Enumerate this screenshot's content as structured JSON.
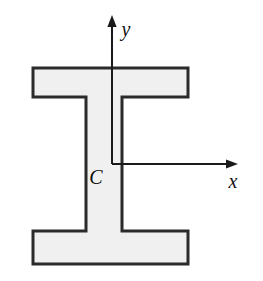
{
  "figure": {
    "kind": "engineering-cross-section-diagram",
    "background_color": "#ffffff",
    "width": 263,
    "height": 281
  },
  "shape": {
    "name": "I-beam-cross-section",
    "fill_color": "#f0f0f0",
    "stroke_color": "#2b2b2b",
    "stroke_width": 3,
    "outline_path": "M 33 68 L 188 68 L 188 97 L 122 97 L 122 231 L 188 231 L 188 264 L 33 264 L 33 231 L 86 231 L 86 97 L 33 97 Z",
    "parts": {
      "top_flange": {
        "label": "top flange",
        "x1": 33,
        "y1": 68,
        "x2": 188,
        "y2": 97
      },
      "web": {
        "label": "web",
        "x1": 86,
        "y1": 97,
        "x2": 122,
        "y2": 231
      },
      "bottom_flange": {
        "label": "bottom flange",
        "x1": 33,
        "y1": 231,
        "x2": 188,
        "y2": 264
      }
    }
  },
  "axes": {
    "stroke_color": "#1a1a1a",
    "stroke_width": 2,
    "origin": {
      "x": 112,
      "y": 164
    },
    "y_axis": {
      "label": "y",
      "label_x": 126,
      "label_y": 36,
      "label_size": 20,
      "line": {
        "x1": 112,
        "y1": 164,
        "x2": 112,
        "y2": 24
      },
      "arrow_tip": {
        "x": 112,
        "y": 15
      },
      "direction": "up"
    },
    "x_axis": {
      "label": "x",
      "label_x": 233,
      "label_y": 188,
      "label_size": 20,
      "line": {
        "x1": 112,
        "y1": 164,
        "x2": 228,
        "y2": 164
      },
      "arrow_tip": {
        "x": 238,
        "y": 164
      },
      "direction": "right"
    }
  },
  "annotations": {
    "centroid": {
      "label": "C",
      "meaning": "centroid",
      "x": 96,
      "y": 184,
      "size": 20
    }
  }
}
